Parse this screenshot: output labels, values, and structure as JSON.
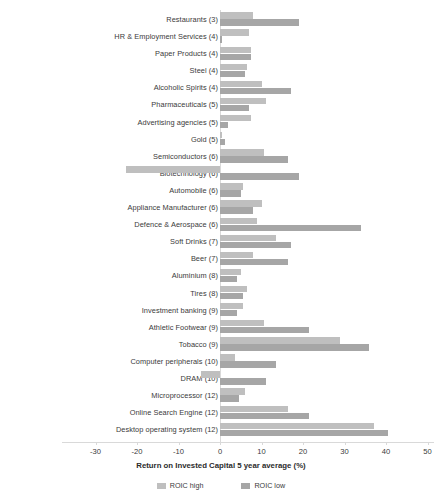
{
  "chart_data": {
    "type": "bar",
    "orientation": "horizontal",
    "title": "",
    "xlabel": "Return on Invested Capital 5 year average (%)",
    "ylabel": "",
    "xlim": [
      -30,
      50
    ],
    "xticks": [
      -30,
      -20,
      -10,
      0,
      10,
      20,
      30,
      40,
      50
    ],
    "grid": false,
    "legend_position": "bottom",
    "categories": [
      "Restaurants (3)",
      "HR & Employment Services (4)",
      "Paper Products (4)",
      "Steel (4)",
      "Alcoholic Spirits (4)",
      "Pharmaceuticals (5)",
      "Advertising agencies (5)",
      "Gold (5)",
      "Semiconductors (6)",
      "Biotechnology (6)",
      "Automobile (6)",
      "Appliance Manufacturer (6)",
      "Defence & Aerospace (6)",
      "Soft Drinks (7)",
      "Beer (7)",
      "Aluminium (8)",
      "Tires (8)",
      "Investment banking (9)",
      "Athletic Footwear (9)",
      "Tobacco (9)",
      "Computer peripherals (10)",
      "DRAM (10)",
      "Microprocessor (12)",
      "Online Search Engine (12)",
      "Desktop operating system (12)"
    ],
    "series": [
      {
        "name": "ROIC high",
        "color": "#bfbfbf",
        "values": [
          8.0,
          7.0,
          7.5,
          6.5,
          10.0,
          11.0,
          7.5,
          0.6,
          10.5,
          -22.6,
          5.5,
          10.0,
          9.0,
          13.5,
          8.0,
          5.0,
          6.5,
          5.5,
          10.5,
          29.0,
          3.5,
          -4.6,
          6.0,
          16.5,
          37.0
        ]
      },
      {
        "name": "ROIC low",
        "color": "#a6a6a6",
        "values": [
          19.0,
          0.4,
          7.5,
          6.0,
          17.0,
          7.0,
          2.0,
          1.2,
          16.5,
          19.0,
          5.0,
          8.0,
          34.0,
          17.0,
          16.5,
          4.0,
          5.5,
          4.0,
          21.5,
          36.0,
          13.5,
          11.0,
          4.5,
          21.5,
          40.5
        ]
      }
    ]
  },
  "legend": {
    "items": [
      {
        "label": "ROIC high",
        "color": "#bfbfbf"
      },
      {
        "label": "ROIC low",
        "color": "#a6a6a6"
      }
    ]
  }
}
